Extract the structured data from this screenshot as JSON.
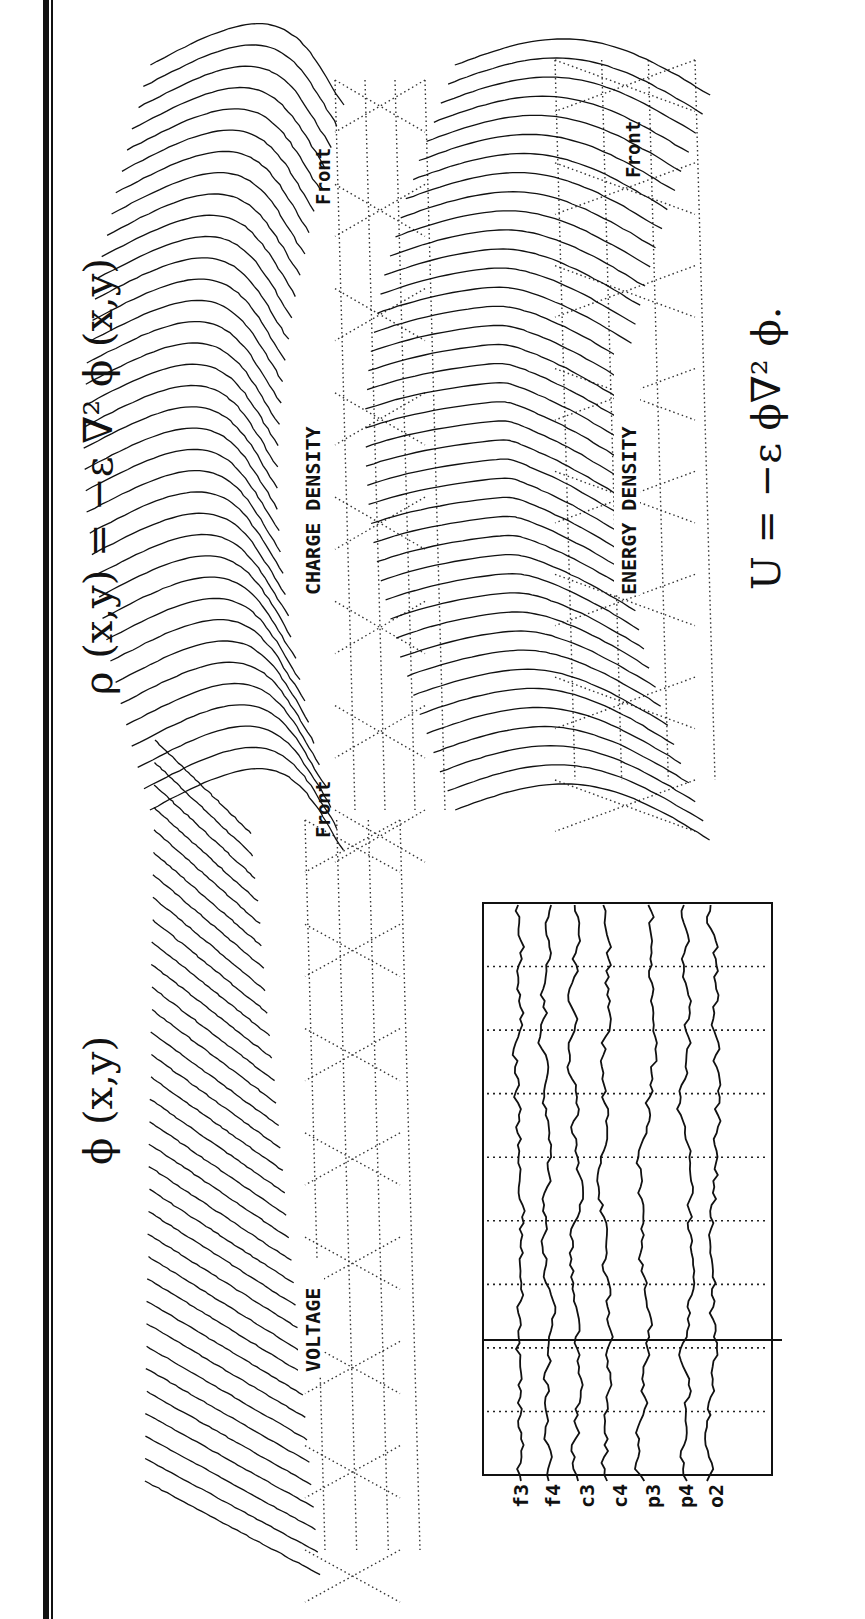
{
  "figure": {
    "orientation": "rotated 90° clockwise (text reads bottom-to-top)",
    "frame_color": "#111111",
    "background": "#ffffff"
  },
  "equations": {
    "phi": "ϕ (x,y)",
    "rho": "ρ (x,y)  =  −ε ∇² ϕ (x,y)",
    "energy": "U  =  −ε ϕ∇² ϕ."
  },
  "panels": {
    "voltage": {
      "label": "VOLTAGE",
      "front_label": "Front",
      "surface": {
        "x0": 145,
        "y0": 740,
        "x1": 320,
        "y1": 1520,
        "rows": 34,
        "shape": "ramp"
      }
    },
    "charge": {
      "label": "CHARGE DENSITY",
      "front_label": "Front",
      "surface": {
        "x0": 110,
        "y0": 65,
        "x1": 345,
        "y1": 810,
        "rows": 36,
        "shape": "saddle"
      }
    },
    "energy": {
      "label": "ENERGY DENSITY",
      "front_label": "Front",
      "surface": {
        "x0": 395,
        "y0": 65,
        "x1": 690,
        "y1": 810,
        "rows": 40,
        "shape": "dip"
      }
    }
  },
  "eeg": {
    "box": {
      "x": 483,
      "y": 903,
      "w": 289,
      "h": 572
    },
    "cursor_y": 1340,
    "channels": [
      "f3",
      "f4",
      "c3",
      "c4",
      "p3",
      "p4",
      "o2"
    ],
    "channel_x": [
      520,
      548,
      574,
      605,
      645,
      683,
      712
    ],
    "grid_rows": 9
  },
  "chart_data": {
    "type": "heatmap",
    "plots": [
      {
        "name": "VOLTAGE",
        "equation": "ϕ (x,y)",
        "orientation_label": "Front"
      },
      {
        "name": "CHARGE DENSITY",
        "equation": "ρ (x,y) = −ε ∇² ϕ (x,y)",
        "orientation_label": "Front"
      },
      {
        "name": "ENERGY DENSITY",
        "equation": "U = −ε ϕ∇² ϕ.",
        "orientation_label": "Front"
      }
    ],
    "eeg_channels": [
      "f3",
      "f4",
      "c3",
      "c4",
      "p3",
      "p4",
      "o2"
    ],
    "xlabel": "",
    "ylabel": "",
    "grid": true
  }
}
